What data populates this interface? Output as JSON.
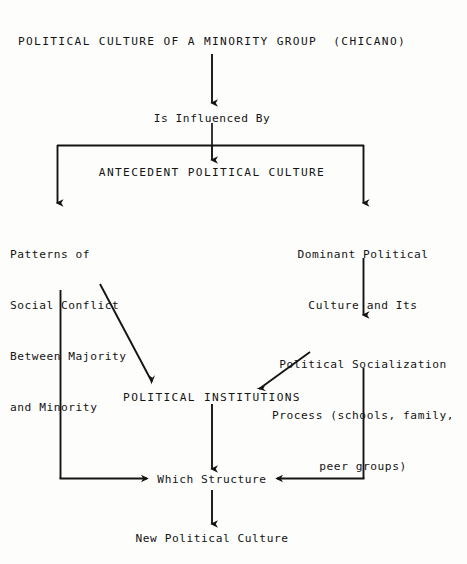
{
  "diagram": {
    "title_node": "POLITICAL CULTURE OF A MINORITY GROUP  (CHICANO)",
    "relation_label": "Is Influenced By",
    "antecedent_node": "ANTECEDENT POLITICAL CULTURE",
    "left_branch": {
      "line1": "Patterns of",
      "line2": "Social Conflict",
      "line3": "Between Majority",
      "line4": "and Minority"
    },
    "right_branch": {
      "line1": "Dominant Political",
      "line2": "Culture and Its"
    },
    "socialization": {
      "line1": "Political Socialization",
      "line2": "Process (schools, family,",
      "line3": "peer groups)"
    },
    "institutions_node": "POLITICAL INSTITUTIONS",
    "structure_node": "Which Structure",
    "outcome_node": "New Political Culture",
    "colors": {
      "ink": "#141414",
      "paper": "#fdfdfb"
    }
  }
}
